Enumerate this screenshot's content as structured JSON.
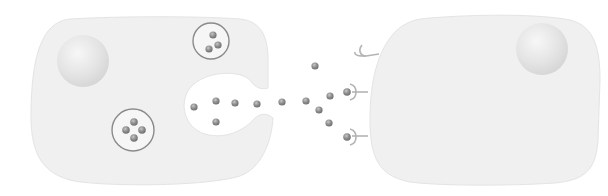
{
  "diagram": {
    "colors": {
      "cell_fill": "#f0f0f0",
      "cell_edge": "#e2e2e2",
      "nucleus_fill": "#e6e6e6",
      "vesicle_stroke": "#8a8a8a",
      "molecule_fill": "#8c8c8c",
      "receptor_stroke": "#b4b4b4"
    },
    "secreting_cell": {
      "label": "secreting-cell",
      "vesicles": [
        {
          "label": "vesicle-upper",
          "molecule_count": 3
        },
        {
          "label": "vesicle-lower",
          "molecule_count": 4
        }
      ],
      "exocytosis_pocket_molecule_count": 5
    },
    "free_molecule_count": 6,
    "target_cell": {
      "label": "target-cell",
      "receptors": [
        {
          "label": "receptor-empty",
          "bound": false
        },
        {
          "label": "receptor-bound-1",
          "bound": true
        },
        {
          "label": "receptor-bound-2",
          "bound": true
        }
      ]
    }
  }
}
